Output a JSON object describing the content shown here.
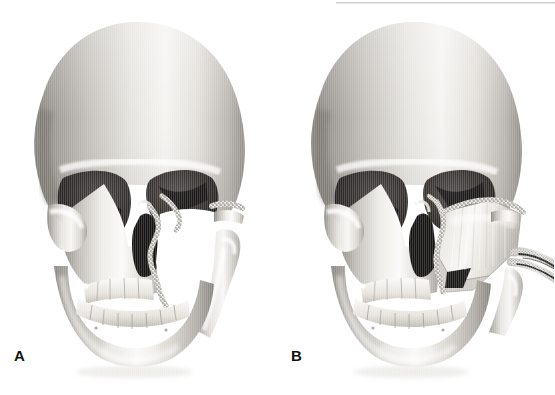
{
  "figure": {
    "kind": "medical-illustration",
    "modality": "grayscale 3D skull rendering",
    "background_color": "#ffffff",
    "width": 555,
    "height": 395,
    "top_rule": {
      "visible": true,
      "color": "#c9c9c9",
      "x": 336,
      "y": 2,
      "width": 219,
      "height": 2
    }
  },
  "panels": [
    {
      "id": "a",
      "label": "A",
      "label_x": 14,
      "label_y": 348,
      "caption_text": "",
      "description": "Anterior view of skull with left maxillectomy defect; stippled osteotomy margins at the zygomatic arch, infraorbital rim, nasal aperture and alveolus. Resected maxilla leaves a white void.",
      "features": [
        "cranial vault",
        "right orbit",
        "left orbit",
        "nasal aperture",
        "maxillary defect void",
        "stippled resection margin",
        "cut zygomatic arch stump",
        "mandibular ramus",
        "maxillary teeth",
        "mandibular teeth",
        "mandible body"
      ]
    },
    {
      "id": "b",
      "label": "B",
      "label_x": 291,
      "label_y": 348,
      "caption_text": "",
      "description": "Same skull after reconstruction: an osteocutaneous free bone flap is inset into the maxillary defect, fixed at the zygomatic and infraorbital osteotomy lines, with the vascular pedicle (artery and vein) emerging laterally.",
      "features": [
        "cranial vault",
        "right orbit",
        "left orbit",
        "nasal aperture",
        "bone free flap",
        "flap osteotomy stipple",
        "vascular pedicle",
        "cut zygomatic arch stump",
        "mandibular ramus",
        "maxillary teeth",
        "mandibular teeth",
        "mandible body"
      ]
    }
  ],
  "palette": {
    "bone_light": "#f7f6f4",
    "bone_mid": "#d2cfc9",
    "bone_shadow": "#8e8b86",
    "bone_deep_shadow": "#6a6763",
    "orbit_dark": "#2f2d2c",
    "orbit_darkest": "#161514",
    "nasal_dark": "#1d1c1b",
    "stipple": "#7a7772",
    "outline": "#9a9792",
    "label_color": "#121212",
    "rule_color": "#c9c9c9",
    "background": "#ffffff"
  }
}
